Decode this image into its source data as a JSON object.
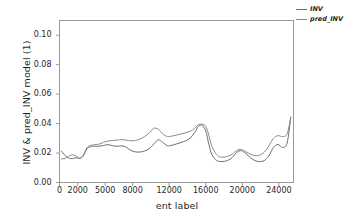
{
  "chart_data": {
    "type": "line",
    "title": "",
    "xlabel": "ent label",
    "ylabel": "INV & pred_INV model  (1)",
    "xlim": [
      0,
      25600
    ],
    "ylim": [
      0.0,
      0.11
    ],
    "grid": false,
    "legend_position": "top-right-outside",
    "yticks": [
      "0.00",
      "0.02",
      "0.04",
      "0.06",
      "0.08",
      "0.10"
    ],
    "ytick_values": [
      0.0,
      0.02,
      0.04,
      0.06,
      0.08,
      0.1
    ],
    "xticks": [
      "0",
      "2000",
      "5000",
      "8000",
      "12000",
      "16000",
      "20000",
      "24000"
    ],
    "xtick_values": [
      0,
      2000,
      5000,
      8000,
      12000,
      16000,
      20000,
      24000
    ],
    "series": [
      {
        "name": "INV",
        "color": "#6e6e6e",
        "x": [
          200,
          600,
          1000,
          1400,
          1800,
          2200,
          2600,
          3000,
          3400,
          3800,
          4300,
          4800,
          5300,
          5800,
          6300,
          6800,
          7300,
          7800,
          8300,
          8800,
          9300,
          9800,
          10300,
          10800,
          11300,
          11800,
          12300,
          12800,
          13300,
          13800,
          14300,
          14800,
          15200,
          15600,
          16000,
          16300,
          16600,
          17000,
          17400,
          17900,
          18400,
          18900,
          19400,
          19900,
          20400,
          20900,
          21400,
          21900,
          22400,
          22900,
          23400,
          23900,
          24400,
          24900,
          25300
        ],
        "y": [
          0.0213,
          0.0185,
          0.0166,
          0.0162,
          0.0168,
          0.0163,
          0.018,
          0.0228,
          0.0243,
          0.0247,
          0.0246,
          0.0251,
          0.0257,
          0.025,
          0.0246,
          0.0249,
          0.024,
          0.0218,
          0.0208,
          0.0207,
          0.0214,
          0.0229,
          0.026,
          0.029,
          0.0272,
          0.025,
          0.0253,
          0.0262,
          0.0272,
          0.0283,
          0.0302,
          0.034,
          0.0381,
          0.0388,
          0.035,
          0.027,
          0.02,
          0.016,
          0.0144,
          0.0143,
          0.015,
          0.017,
          0.0205,
          0.0216,
          0.0196,
          0.0168,
          0.0148,
          0.0142,
          0.0149,
          0.018,
          0.0237,
          0.0258,
          0.0238,
          0.0268,
          0.0445
        ]
      },
      {
        "name": "pred_INV",
        "color": "#8a8a8a",
        "x": [
          200,
          600,
          1000,
          1400,
          1800,
          2200,
          2600,
          3000,
          3400,
          3800,
          4300,
          4800,
          5300,
          5800,
          6300,
          6800,
          7300,
          7800,
          8300,
          8800,
          9300,
          9800,
          10300,
          10800,
          11300,
          11800,
          12300,
          12800,
          13300,
          13800,
          14300,
          14800,
          15200,
          15600,
          16000,
          16300,
          16600,
          17000,
          17400,
          17900,
          18400,
          18900,
          19400,
          19900,
          20400,
          20900,
          21400,
          21900,
          22400,
          22900,
          23400,
          23900,
          24400,
          24900,
          25300
        ],
        "y": [
          0.0161,
          0.0163,
          0.0178,
          0.0188,
          0.018,
          0.0166,
          0.0186,
          0.0236,
          0.0252,
          0.0256,
          0.026,
          0.0272,
          0.0282,
          0.0285,
          0.0288,
          0.0291,
          0.0288,
          0.0283,
          0.0286,
          0.0295,
          0.0312,
          0.0335,
          0.0368,
          0.0362,
          0.033,
          0.0312,
          0.0315,
          0.0322,
          0.033,
          0.0338,
          0.0348,
          0.0368,
          0.0392,
          0.0396,
          0.0382,
          0.033,
          0.0258,
          0.0206,
          0.0178,
          0.0172,
          0.0178,
          0.0192,
          0.0218,
          0.0224,
          0.0208,
          0.0192,
          0.0182,
          0.0186,
          0.0206,
          0.0248,
          0.03,
          0.0318,
          0.0312,
          0.033,
          0.0442
        ]
      }
    ]
  },
  "legend": {
    "items": [
      {
        "label": "INV"
      },
      {
        "label": "pred_INV"
      }
    ]
  },
  "style": {
    "frame_color": "#9a9a9a",
    "tick_color": "#9a9a9a",
    "background": "#ffffff"
  }
}
